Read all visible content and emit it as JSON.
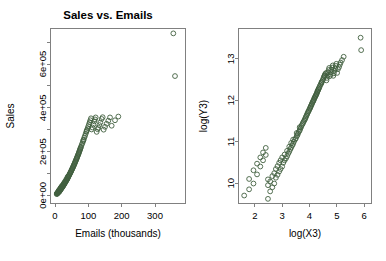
{
  "figure": {
    "background": "#ffffff",
    "point_color": "#42603f",
    "axis_color": "#808080"
  },
  "chart_data": [
    {
      "type": "scatter",
      "panel": "left",
      "title": "Sales vs. Emails",
      "xlabel": "Emails (thousands)",
      "ylabel": "Sales",
      "xlim": [
        -12,
        390
      ],
      "ylim": [
        -35000,
        760000
      ],
      "xticks": [
        0,
        100,
        200,
        300
      ],
      "xticklabels": [
        "0",
        "100",
        "200",
        "300"
      ],
      "yticks": [
        0,
        200000,
        400000,
        600000
      ],
      "yticklabels": [
        "0e+00",
        "2e+05",
        "4e+05",
        "6e+05"
      ],
      "minor_yticks": [
        100000,
        300000,
        500000,
        700000
      ],
      "grid": false,
      "marker": "open-circle",
      "marker_color": "#42603f",
      "x": [
        5,
        6,
        6,
        7,
        7,
        8,
        8,
        9,
        9,
        10,
        10,
        11,
        11,
        12,
        12,
        12,
        13,
        13,
        14,
        14,
        15,
        15,
        16,
        16,
        17,
        17,
        18,
        18,
        19,
        19,
        20,
        20,
        21,
        22,
        22,
        23,
        24,
        24,
        25,
        26,
        26,
        27,
        28,
        28,
        29,
        30,
        30,
        31,
        32,
        33,
        34,
        34,
        35,
        36,
        37,
        38,
        38,
        39,
        40,
        41,
        42,
        43,
        44,
        45,
        46,
        47,
        48,
        49,
        50,
        51,
        52,
        53,
        54,
        55,
        56,
        57,
        58,
        59,
        60,
        61,
        62,
        63,
        64,
        65,
        66,
        67,
        68,
        69,
        70,
        71,
        72,
        73,
        74,
        75,
        76,
        77,
        78,
        80,
        82,
        84,
        85,
        86,
        88,
        90,
        92,
        94,
        95,
        96,
        98,
        100,
        102,
        104,
        106,
        108,
        110,
        112,
        115,
        118,
        120,
        122,
        125,
        128,
        130,
        133,
        136,
        140,
        143,
        146,
        150,
        155,
        160,
        165,
        170,
        180,
        190,
        355,
        360
      ],
      "y": [
        6000,
        7000,
        9000,
        8000,
        11000,
        10000,
        13000,
        12000,
        15000,
        14000,
        17000,
        16000,
        19000,
        15000,
        21000,
        24000,
        18000,
        23000,
        20000,
        26000,
        22000,
        28000,
        25000,
        31000,
        27000,
        33000,
        29000,
        36000,
        31000,
        38000,
        33000,
        41000,
        36000,
        38000,
        44000,
        40000,
        42000,
        48000,
        45000,
        47000,
        53000,
        50000,
        52000,
        58000,
        55000,
        57000,
        63000,
        60000,
        63000,
        65000,
        68000,
        74000,
        70000,
        73000,
        76000,
        78000,
        85000,
        82000,
        85000,
        88000,
        91000,
        94000,
        97000,
        100000,
        103000,
        106000,
        109000,
        112000,
        116000,
        119000,
        122000,
        125000,
        129000,
        132000,
        136000,
        139000,
        143000,
        146000,
        150000,
        154000,
        157000,
        161000,
        165000,
        169000,
        172000,
        176000,
        180000,
        184000,
        188000,
        192000,
        196000,
        200000,
        205000,
        209000,
        213000,
        217000,
        222000,
        230000,
        238000,
        246000,
        251000,
        255000,
        264000,
        272000,
        281000,
        290000,
        294000,
        299000,
        307000,
        316000,
        325000,
        334000,
        343000,
        352000,
        301000,
        310000,
        324000,
        338000,
        347000,
        356000,
        290000,
        302000,
        309000,
        321000,
        333000,
        349000,
        357000,
        300000,
        313000,
        327000,
        341000,
        356000,
        318000,
        343000,
        360000,
        740000,
        545000
      ]
    },
    {
      "type": "scatter",
      "panel": "right",
      "title": "",
      "xlabel": "log(X3)",
      "ylabel": "log(Y3)",
      "xlim": [
        1.42,
        6.25
      ],
      "ylim": [
        9.52,
        13.72
      ],
      "xticks": [
        2,
        3,
        4,
        5,
        6
      ],
      "xticklabels": [
        "2",
        "3",
        "4",
        "5",
        "6"
      ],
      "yticks": [
        10,
        11,
        12,
        13
      ],
      "yticklabels": [
        "10",
        "11",
        "12",
        "13"
      ],
      "grid": false,
      "marker": "open-circle",
      "marker_color": "#42603f",
      "x": [
        1.61,
        1.79,
        1.79,
        1.95,
        1.95,
        2.08,
        2.08,
        2.2,
        2.2,
        2.3,
        2.3,
        2.4,
        2.4,
        2.48,
        2.48,
        2.48,
        2.56,
        2.56,
        2.64,
        2.64,
        2.71,
        2.71,
        2.77,
        2.77,
        2.83,
        2.83,
        2.89,
        2.89,
        2.94,
        2.94,
        3.0,
        3.0,
        3.04,
        3.09,
        3.09,
        3.14,
        3.18,
        3.18,
        3.22,
        3.26,
        3.26,
        3.3,
        3.33,
        3.33,
        3.37,
        3.4,
        3.4,
        3.43,
        3.47,
        3.5,
        3.53,
        3.53,
        3.56,
        3.58,
        3.61,
        3.64,
        3.64,
        3.66,
        3.69,
        3.71,
        3.74,
        3.76,
        3.78,
        3.81,
        3.83,
        3.85,
        3.87,
        3.89,
        3.91,
        3.93,
        3.95,
        3.97,
        3.99,
        4.01,
        4.03,
        4.04,
        4.06,
        4.08,
        4.09,
        4.11,
        4.13,
        4.14,
        4.16,
        4.17,
        4.19,
        4.2,
        4.22,
        4.23,
        4.25,
        4.26,
        4.28,
        4.29,
        4.3,
        4.32,
        4.33,
        4.34,
        4.36,
        4.38,
        4.41,
        4.43,
        4.44,
        4.45,
        4.48,
        4.5,
        4.52,
        4.54,
        4.55,
        4.56,
        4.58,
        4.61,
        4.62,
        4.64,
        4.66,
        4.68,
        4.7,
        4.72,
        4.74,
        4.77,
        4.79,
        4.8,
        4.83,
        4.85,
        4.87,
        4.89,
        4.91,
        4.94,
        4.96,
        4.98,
        5.01,
        5.04,
        5.08,
        5.11,
        5.14,
        5.19,
        5.25,
        5.87,
        5.89
      ],
      "y": [
        9.7,
        9.85,
        10.1,
        9.99,
        10.31,
        10.21,
        10.47,
        10.4,
        10.62,
        10.55,
        10.74,
        10.68,
        10.85,
        9.62,
        9.95,
        10.09,
        9.8,
        10.04,
        9.9,
        10.17,
        9.99,
        10.24,
        10.13,
        10.34,
        10.2,
        10.41,
        10.28,
        10.49,
        10.34,
        10.55,
        10.4,
        10.62,
        10.49,
        10.55,
        10.69,
        10.6,
        10.65,
        10.78,
        10.71,
        10.76,
        10.88,
        10.82,
        10.86,
        10.97,
        10.91,
        10.95,
        11.05,
        11.0,
        11.05,
        11.08,
        11.13,
        11.21,
        11.16,
        11.2,
        11.24,
        11.27,
        11.35,
        11.31,
        11.35,
        11.39,
        11.42,
        11.45,
        11.48,
        11.51,
        11.54,
        11.57,
        11.6,
        11.63,
        11.66,
        11.69,
        11.72,
        11.74,
        11.77,
        11.8,
        11.82,
        11.85,
        11.87,
        11.9,
        11.92,
        11.95,
        11.97,
        11.99,
        12.01,
        12.04,
        12.06,
        12.08,
        12.1,
        12.12,
        12.14,
        12.16,
        12.19,
        12.21,
        12.23,
        12.25,
        12.27,
        12.29,
        12.31,
        12.35,
        12.38,
        12.41,
        12.43,
        12.45,
        12.48,
        12.51,
        12.55,
        12.58,
        12.59,
        12.61,
        12.64,
        12.66,
        12.48,
        12.54,
        12.6,
        12.67,
        12.73,
        12.78,
        12.58,
        12.62,
        12.68,
        12.74,
        12.79,
        12.84,
        12.59,
        12.65,
        12.71,
        12.77,
        12.83,
        12.88,
        12.66,
        12.75,
        12.8,
        12.86,
        12.91,
        12.97,
        13.05,
        13.51,
        13.21
      ]
    }
  ]
}
